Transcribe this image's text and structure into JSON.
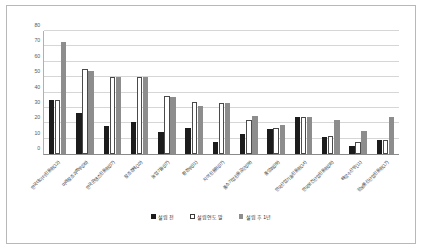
{
  "chart_data": {
    "type": "bar",
    "title": "",
    "xlabel": "",
    "ylabel": "",
    "ylim": [
      0,
      80
    ],
    "yticks": [
      0,
      10,
      20,
      30,
      40,
      50,
      60,
      70,
      80
    ],
    "grid": true,
    "legend_position": "bottom-center",
    "categories": [
      "한국데이터진흥원(12)",
      "미래창조과학부(06)",
      "한국콘텐츠진흥원(07)",
      "창조경제(10)",
      "농업기술(07)",
      "환경부(01)",
      "지역진흥원(07)",
      "중소기업진흥공단(09)",
      "중앙회(09)",
      "한국산업기술진흥원(14)",
      "한국보건산업진흥원(08)",
      "해양수산부(11)",
      "정보통신산업진흥원(17)"
    ],
    "series": [
      {
        "name": "설립 전",
        "color": "#1c1c1c",
        "values": [
          35,
          27,
          18,
          21,
          14,
          17,
          8,
          13,
          16,
          24,
          11,
          5,
          9
        ]
      },
      {
        "name": "설립연도 말",
        "color": "#ffffff",
        "values": [
          35,
          55,
          50,
          50,
          38,
          34,
          33,
          22,
          17,
          24,
          12,
          8,
          9
        ]
      },
      {
        "name": "설립 후 1년",
        "color": "#8d8d8d",
        "values": [
          73,
          54,
          50,
          50,
          37,
          31,
          33,
          25,
          19,
          24,
          22,
          15,
          24
        ]
      }
    ]
  }
}
